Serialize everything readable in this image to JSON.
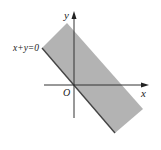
{
  "figure": {
    "type": "coordinate-plane-region",
    "labels": {
      "y_axis": "y",
      "x_axis": "x",
      "origin": "O",
      "boundary_line": "x+y=0"
    },
    "colors": {
      "region_fill": "#b3b3b3",
      "axis": "#333333",
      "boundary": "#444444",
      "background": "#ffffff"
    },
    "region": {
      "description": "Shaded strip between line x+y=0 and a parallel line above it",
      "vertices_px": [
        [
          42,
          48
        ],
        [
          67,
          23
        ],
        [
          143,
          109
        ],
        [
          115,
          133
        ]
      ]
    }
  }
}
